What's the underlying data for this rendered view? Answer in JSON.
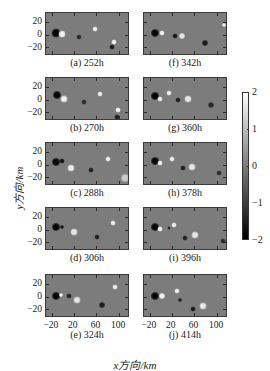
{
  "chart_data": {
    "type": "heatmap",
    "title": "",
    "xlabel": "x方向/km",
    "ylabel": "y方向/km",
    "x_ticks": [
      "-20",
      "20",
      "60",
      "100"
    ],
    "y_ticks": [
      "20",
      "0",
      "-20"
    ],
    "xlim": [
      -30,
      120
    ],
    "ylim": [
      -35,
      35
    ],
    "colorbar": {
      "ticks": [
        "2",
        "1",
        "0",
        "-1",
        "-2"
      ],
      "range": [
        -2,
        2
      ],
      "colormap": "grayscale (black=-2, white=2)"
    },
    "layout": "5 rows x 2 columns",
    "panels": [
      {
        "id": "a",
        "label": "(a) 252h",
        "time_h": 252
      },
      {
        "id": "b",
        "label": "(b) 270h",
        "time_h": 270
      },
      {
        "id": "c",
        "label": "(c) 288h",
        "time_h": 288
      },
      {
        "id": "d",
        "label": "(d) 306h",
        "time_h": 306
      },
      {
        "id": "e",
        "label": "(e) 324h",
        "time_h": 324
      },
      {
        "id": "f",
        "label": "(f) 342h",
        "time_h": 342
      },
      {
        "id": "g",
        "label": "(g) 360h",
        "time_h": 360
      },
      {
        "id": "h",
        "label": "(h) 378h",
        "time_h": 378
      },
      {
        "id": "i",
        "label": "(i) 396h",
        "time_h": 396
      },
      {
        "id": "j",
        "label": "(j) 414h",
        "time_h": 414
      }
    ]
  },
  "axis": {
    "xlabel": "x方向/km",
    "ylabel": "y方向/km",
    "yticks": [
      "20",
      "0",
      "−20"
    ],
    "xticks": [
      "−20",
      "20",
      "60",
      "100"
    ]
  },
  "colorbar": {
    "t2": "2",
    "t1": "1",
    "t0": "0",
    "tm1": "−1",
    "tm2": "−2"
  },
  "captions": {
    "a": "(a) 252h",
    "b": "(b) 270h",
    "c": "(c) 288h",
    "d": "(d) 306h",
    "e": "(e) 324h",
    "f": "(f) 342h",
    "g": "(g) 360h",
    "h": "(h) 378h",
    "i": "(i) 396h",
    "j": "(j) 414h"
  }
}
